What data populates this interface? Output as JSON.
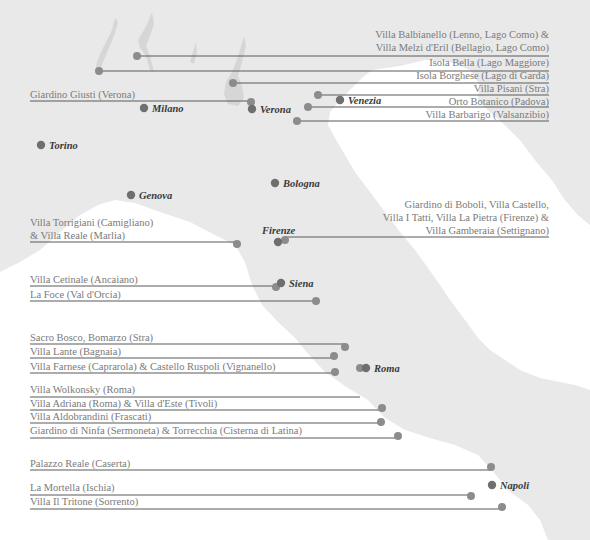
{
  "map": {
    "title": "Italian gardens map",
    "colors": {
      "land": "#e9e9e9",
      "sea": "#ffffff",
      "lake": "#d6d6d6",
      "city_dot": "#6f6f6f",
      "garden_dot": "#8c8c8c",
      "leader_line": "#5a5a5a",
      "garden_text": "#7a7a7a",
      "city_text": "#3a3a3a"
    },
    "cities": [
      {
        "name": "Milano"
      },
      {
        "name": "Verona"
      },
      {
        "name": "Venezia"
      },
      {
        "name": "Torino"
      },
      {
        "name": "Bologna"
      },
      {
        "name": "Genova"
      },
      {
        "name": "Firenze"
      },
      {
        "name": "Siena"
      },
      {
        "name": "Roma"
      },
      {
        "name": "Napoli"
      }
    ],
    "gardens": [
      {
        "lines": [
          "Villa Balbianello (Lenno, Lago Como) &",
          "Villa Melzi d'Eril (Bellagio, Lago Como)"
        ]
      },
      {
        "lines": [
          "Isola Bella (Lago Maggiore)"
        ]
      },
      {
        "lines": [
          "Isola Borghese (Lago di Garda)"
        ]
      },
      {
        "lines": [
          "Villa Pisani (Stra)"
        ]
      },
      {
        "lines": [
          "Orto Botanico (Padova)"
        ]
      },
      {
        "lines": [
          "Villa Barbarigo (Valsanzibio)"
        ]
      },
      {
        "lines": [
          "Giardino Giusti (Verona)"
        ]
      },
      {
        "lines": [
          "Giardino di Boboli, Villa Castello,",
          "Villa I Tatti, Villa La Pietra (Firenze) &",
          "Villa Gamberaia (Settignano)"
        ]
      },
      {
        "lines": [
          "Villa Torrigiani (Camigliano)",
          "& Villa Reale (Marlia)"
        ]
      },
      {
        "lines": [
          "Villa Cetinale (Ancaiano)"
        ]
      },
      {
        "lines": [
          "La Foce (Val d'Orcia)"
        ]
      },
      {
        "lines": [
          "Sacro Bosco, Bomarzo (Stra)"
        ]
      },
      {
        "lines": [
          "Villa Lante (Bagnaia)"
        ]
      },
      {
        "lines": [
          "Villa Farnese (Caprarola) & Castello Ruspoli (Vignanello)"
        ]
      },
      {
        "lines": [
          "Villa Wolkonsky (Roma)"
        ]
      },
      {
        "lines": [
          "Villa Adriana (Roma) & Villa d'Este (Tivoli)"
        ]
      },
      {
        "lines": [
          "Villa Aldobrandini (Frascati)"
        ]
      },
      {
        "lines": [
          "Giardino di Ninfa (Sermoneta) & Torrecchia (Cisterna di Latina)"
        ]
      },
      {
        "lines": [
          "Palazzo Reale (Caserta)"
        ]
      },
      {
        "lines": [
          "La Mortella (Ischia)"
        ]
      },
      {
        "lines": [
          "Villa Il Tritone (Sorrento)"
        ]
      }
    ]
  }
}
